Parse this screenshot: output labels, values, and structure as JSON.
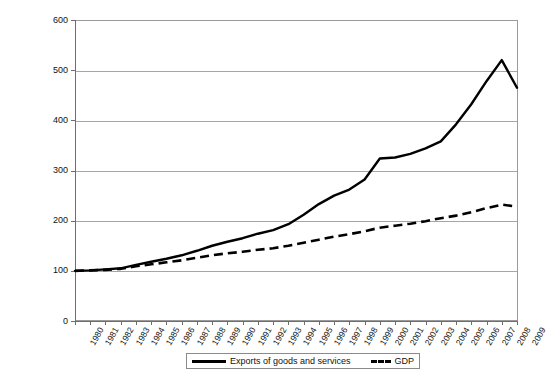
{
  "chart_data": {
    "type": "line",
    "title": "",
    "xlabel": "",
    "ylabel": "",
    "ylim": [
      0,
      600
    ],
    "ytick_step": 100,
    "yticks": [
      "0",
      "100",
      "200",
      "300",
      "400",
      "500",
      "600"
    ],
    "grid": "horizontal",
    "legend_position": "bottom",
    "index_base": "1980 = 100",
    "categories": [
      "1980",
      "1981",
      "1982",
      "1983",
      "1984",
      "1985",
      "1986",
      "1987",
      "1988",
      "1989",
      "1990",
      "1991",
      "1992",
      "1993",
      "1994",
      "1995",
      "1996",
      "1997",
      "1998",
      "1999",
      "2000",
      "2001",
      "2002",
      "2003",
      "2004",
      "2005",
      "2006",
      "2007",
      "2008",
      "2009"
    ],
    "series": [
      {
        "name": "Exports of goods and services",
        "style": "solid",
        "color": "#000000",
        "values": [
          100,
          101,
          103,
          105,
          112,
          118,
          124,
          131,
          140,
          150,
          158,
          165,
          174,
          181,
          193,
          212,
          233,
          250,
          262,
          282,
          324,
          326,
          333,
          344,
          358,
          392,
          432,
          478,
          520,
          465
        ]
      },
      {
        "name": "GDP",
        "style": "dashed",
        "color": "#000000",
        "values": [
          100,
          101,
          102,
          104,
          109,
          113,
          117,
          121,
          126,
          131,
          135,
          138,
          142,
          145,
          150,
          156,
          162,
          168,
          173,
          179,
          186,
          190,
          194,
          199,
          205,
          210,
          217,
          225,
          232,
          228
        ]
      }
    ],
    "legend": [
      {
        "label": "Exports of goods and services",
        "style": "solid"
      },
      {
        "label": "GDP",
        "style": "dashed"
      }
    ]
  }
}
